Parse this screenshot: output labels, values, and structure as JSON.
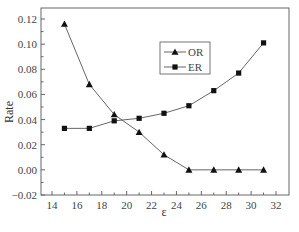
{
  "chart_data": {
    "type": "line",
    "title": "",
    "xlabel": "ε",
    "ylabel": "Rate",
    "x": [
      15,
      17,
      19,
      21,
      23,
      25,
      27,
      29,
      31
    ],
    "series": [
      {
        "name": "OR",
        "marker": "triangle",
        "values": [
          0.116,
          0.068,
          0.044,
          0.03,
          0.012,
          0.0,
          0.0,
          0.0,
          0.0
        ]
      },
      {
        "name": "ER",
        "marker": "square",
        "values": [
          0.033,
          0.033,
          0.039,
          0.041,
          0.045,
          0.051,
          0.063,
          0.077,
          0.101
        ]
      }
    ],
    "xlim": [
      13,
      33
    ],
    "ylim": [
      -0.02,
      0.13
    ],
    "xticks": [
      14,
      16,
      18,
      20,
      22,
      24,
      26,
      28,
      30,
      32
    ],
    "yticks": [
      -0.02,
      0.0,
      0.02,
      0.04,
      0.06,
      0.08,
      0.1,
      0.12
    ],
    "ytick_labels": [
      "-0.02",
      "0.00",
      "0.02",
      "0.04",
      "0.06",
      "0.08",
      "0.10",
      "0.12"
    ],
    "grid": false,
    "legend_position": "upper-right-inside",
    "colors": {
      "line": "#555555",
      "marker": "#111111",
      "axis": "#666666"
    }
  }
}
